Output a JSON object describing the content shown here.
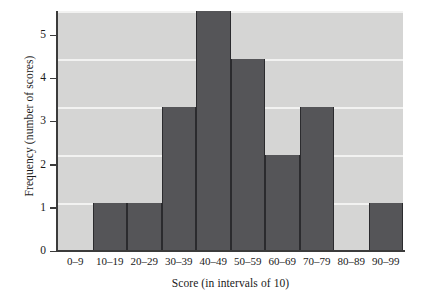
{
  "chart_data": {
    "type": "bar",
    "title": "",
    "xlabel": "Score (in intervals of 10)",
    "ylabel": "Frequency  (number of scores)",
    "categories": [
      "0–9",
      "10–19",
      "20–29",
      "30–39",
      "40–49",
      "50–59",
      "60–69",
      "70–79",
      "80–89",
      "90–99"
    ],
    "values": [
      0,
      1,
      1,
      3,
      5,
      4,
      2,
      3,
      0,
      1
    ],
    "ylim": [
      0,
      5
    ],
    "yticks": [
      0,
      1,
      2,
      3,
      4,
      5
    ],
    "ytick_labels": [
      "0",
      "1",
      "2",
      "3",
      "4",
      "5"
    ],
    "grid": true,
    "grid_axis": "y",
    "legend": false,
    "bar_color": "#555558",
    "plot_background": "#d5d5d4",
    "gridline_color": "#f2f2f1",
    "axis_color": "#3b3b3b"
  }
}
